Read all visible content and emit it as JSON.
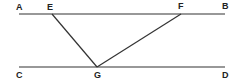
{
  "diagram": {
    "type": "geometry",
    "points": {
      "A": {
        "label": "A",
        "x": 19,
        "y": 14
      },
      "B": {
        "label": "B",
        "x": 225,
        "y": 14
      },
      "C": {
        "label": "C",
        "x": 19,
        "y": 67
      },
      "D": {
        "label": "D",
        "x": 225,
        "y": 67
      },
      "E": {
        "label": "E",
        "x": 52,
        "y": 14
      },
      "F": {
        "label": "F",
        "x": 181,
        "y": 14
      },
      "G": {
        "label": "G",
        "x": 97,
        "y": 67
      }
    },
    "segments": [
      {
        "from": "A",
        "to": "B"
      },
      {
        "from": "C",
        "to": "D"
      },
      {
        "from": "E",
        "to": "G"
      },
      {
        "from": "F",
        "to": "G"
      }
    ],
    "line_color": "#333333"
  }
}
